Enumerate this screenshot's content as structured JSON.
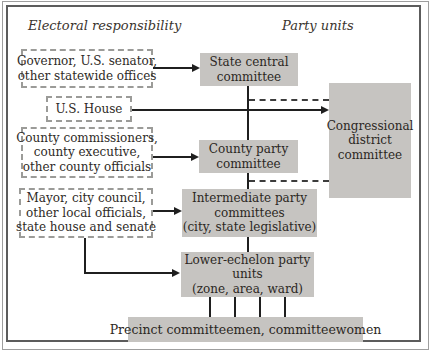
{
  "titles": {
    "electoral": "Electoral responsibility",
    "party": "Party units"
  },
  "electoral_boxes": {
    "governor": {
      "lines": [
        "Governor, U.S. senator,",
        "other statewide offices"
      ]
    },
    "us_house": {
      "lines": [
        "U.S. House"
      ]
    },
    "county": {
      "lines": [
        "County commissioners,",
        "county executive,",
        "other county officials"
      ]
    },
    "mayor": {
      "lines": [
        "Mayor, city council,",
        "other local officials,",
        "state house and senate"
      ]
    }
  },
  "party_boxes": {
    "state_central": {
      "lines": [
        "State central",
        "committee"
      ]
    },
    "congressional": {
      "lines": [
        "Congressional",
        "district",
        "committee"
      ]
    },
    "county_party": {
      "lines": [
        "County party",
        "committee"
      ]
    },
    "intermediate": {
      "lines": [
        "Intermediate party",
        "committees",
        "(city, state legislative)"
      ]
    },
    "lower_echelon": {
      "lines": [
        "Lower-echelon party",
        "units",
        "(zone, area, ward)"
      ]
    },
    "precinct": {
      "lines": [
        "Precinct committeemen, committeewomen"
      ]
    }
  },
  "colors": {
    "box_fill": "#c6c4c1",
    "text": "#2e2a26",
    "solid_line": "#1f1f1f",
    "dashed_line": "#3c3c3c",
    "dashed_border": "#9b9b98",
    "frame_outer": "#9e9e9e",
    "frame_inner": "#5c5c5c",
    "background": "#ffffff"
  }
}
